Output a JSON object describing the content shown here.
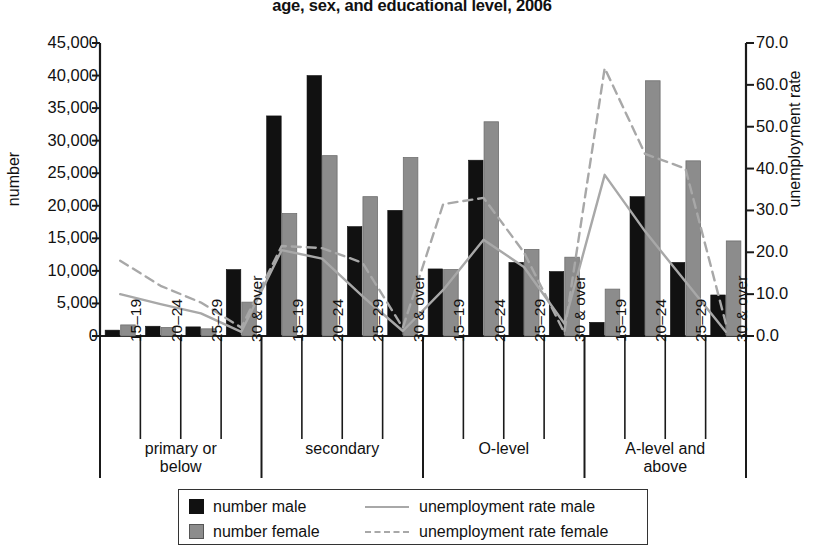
{
  "chart_data": {
    "type": "bar",
    "title": "age, sex, and educational level, 2006",
    "subtitle": "",
    "xlabel": "",
    "ylabel": "number",
    "y2label": "unemployment rate",
    "ylim": [
      0,
      45000
    ],
    "y2lim": [
      0,
      70
    ],
    "grid": false,
    "legend_position": "bottom",
    "y_ticks": [
      "0",
      "5,000",
      "10,000",
      "15,000",
      "20,000",
      "25,000",
      "30,000",
      "35,000",
      "40,000",
      "45,000"
    ],
    "y2_ticks": [
      "0.0",
      "10.0",
      "20.0",
      "30.0",
      "40.0",
      "50.0",
      "60.0",
      "70.0"
    ],
    "groups": [
      "primary or below",
      "secondary",
      "O-level",
      "A-level and above"
    ],
    "categories": [
      "15–19",
      "20–24",
      "25–29",
      "30 & over",
      "15–19",
      "20–24",
      "25–29",
      "30 & over",
      "15–19",
      "20–24",
      "25–29",
      "30 & over",
      "15–19",
      "20–24",
      "25–29",
      "30 & over"
    ],
    "series": [
      {
        "name": "number male",
        "axis": "left",
        "kind": "bar",
        "color": "#111111",
        "values": [
          900,
          1500,
          1400,
          10200,
          33800,
          40000,
          16800,
          19300,
          10300,
          27000,
          11300,
          9900,
          2100,
          21400,
          11300,
          6300
        ]
      },
      {
        "name": "number female",
        "axis": "left",
        "kind": "bar",
        "color": "#8c8c8c",
        "values": [
          1700,
          1300,
          1100,
          5200,
          18800,
          27700,
          21400,
          27400,
          10200,
          32900,
          13300,
          12100,
          7200,
          39200,
          26900,
          14600
        ]
      },
      {
        "name": "unemployment rate male",
        "axis": "right",
        "kind": "line",
        "style": "solid",
        "color": "#a8a8a8",
        "values": [
          10.0,
          7.6,
          5.4,
          1.0,
          20.5,
          18.5,
          9.5,
          1.2,
          11.0,
          23.0,
          16.5,
          3.0,
          38.5,
          25.0,
          13.0,
          1.0
        ]
      },
      {
        "name": "unemployment rate female",
        "axis": "right",
        "kind": "line",
        "style": "dashed",
        "color": "#a8a8a8",
        "values": [
          18.0,
          12.0,
          8.0,
          2.0,
          21.5,
          21.0,
          17.5,
          2.0,
          31.5,
          33.0,
          20.0,
          0.8,
          64.0,
          43.5,
          40.0,
          3.0
        ]
      }
    ],
    "legend": [
      {
        "label": "number male",
        "marker": "black-square"
      },
      {
        "label": "number female",
        "marker": "gray-square"
      },
      {
        "label": "unemployment rate male",
        "marker": "solid-line"
      },
      {
        "label": "unemployment rate female",
        "marker": "dashed-line"
      }
    ]
  }
}
